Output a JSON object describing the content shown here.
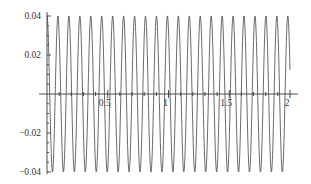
{
  "chart_data": {
    "type": "line",
    "title": "",
    "xlabel": "",
    "ylabel": "",
    "xlim": [
      0,
      2
    ],
    "ylim": [
      -0.04,
      0.04
    ],
    "grid": false,
    "legend": null,
    "x_ticks": [
      0.5,
      1,
      1.5,
      2
    ],
    "x_tick_labels": [
      "0.5",
      "1",
      "1.5",
      "2"
    ],
    "y_ticks": [
      0.04,
      0.02,
      -0.02,
      -0.04
    ],
    "y_tick_labels": [
      "0.04",
      "0.02",
      "-0.02",
      "-0.04"
    ],
    "series": [
      {
        "name": "signal",
        "function": "0.04*cos(2*pi*f*x)",
        "amplitude": 0.04,
        "frequency_cycles_per_unit": 11.1,
        "samples": 1200,
        "color": "#444444"
      }
    ]
  },
  "layout": {
    "origin_px": [
      47,
      94
    ],
    "x_scale_px_per_unit": 121.5,
    "y_scale_px_per_unit": 1950
  }
}
